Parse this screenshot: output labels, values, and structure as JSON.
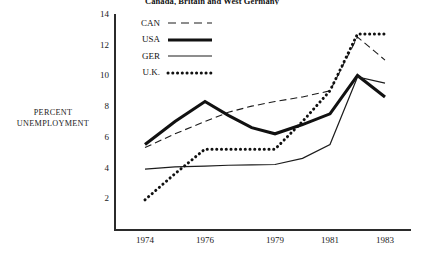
{
  "chart_data": {
    "type": "line",
    "title": "Canada, Britain and West Germany",
    "xlabel": "",
    "ylabel": "PERCENT UNEMPLOYMENT",
    "ylabel_lines": [
      "PERCENT",
      "UNEMPLOYMENT"
    ],
    "ylim": [
      0,
      14
    ],
    "yticks": [
      2,
      4,
      6,
      8,
      10,
      12,
      14
    ],
    "ytick_labels": [
      "2",
      "4",
      "6",
      "8",
      "10",
      "12",
      "14"
    ],
    "xlim": [
      1974,
      1983
    ],
    "xticks": [
      1974,
      1976,
      1979,
      1981,
      1983
    ],
    "xtick_labels": [
      "1974",
      "1976",
      "1979",
      "1981",
      "1983"
    ],
    "grid": false,
    "legend_position": "top-left-inside",
    "x": [
      1974,
      1975,
      1976,
      1977,
      1978,
      1979,
      1980,
      1981,
      1982,
      1983
    ],
    "series": [
      {
        "name": "CAN",
        "label": "CAN",
        "style": "dashed",
        "color": "#1c1c1c",
        "width": 1.1,
        "values": [
          5.3,
          6.2,
          7.0,
          7.6,
          8.0,
          8.3,
          8.6,
          9.0,
          12.5,
          11.0
        ]
      },
      {
        "name": "USA",
        "label": "USA",
        "style": "solid-thick",
        "color": "#111111",
        "width": 3.1,
        "values": [
          5.5,
          7.0,
          8.3,
          7.4,
          6.6,
          6.2,
          6.8,
          7.5,
          10.0,
          8.6
        ]
      },
      {
        "name": "GER",
        "label": "GER",
        "style": "solid-thin",
        "color": "#1c1c1c",
        "width": 1.2,
        "values": [
          3.9,
          4.05,
          4.1,
          4.15,
          4.18,
          4.2,
          4.6,
          5.5,
          9.9,
          9.5
        ]
      },
      {
        "name": "U.K.",
        "label": "U.K.",
        "style": "dotted",
        "color": "#111111",
        "width": 3.0,
        "values": [
          1.9,
          3.6,
          5.2,
          5.2,
          5.2,
          5.2,
          7.0,
          9.0,
          12.7,
          12.7
        ]
      }
    ]
  }
}
